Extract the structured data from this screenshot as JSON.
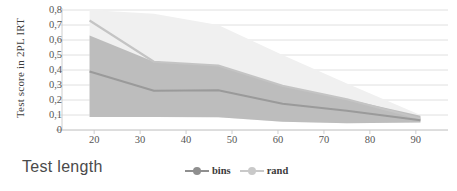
{
  "chart_data": {
    "type": "line",
    "title": "",
    "xlabel": "Test length",
    "ylabel": "Test score in 2PL IRT",
    "xlim": [
      13,
      97
    ],
    "ylim": [
      0,
      0.8
    ],
    "grid": true,
    "legend_position": "bottom",
    "x_ticks": [
      "20",
      "30",
      "40",
      "50",
      "60",
      "70",
      "80",
      "90"
    ],
    "x_tick_values": [
      20,
      30,
      40,
      50,
      60,
      70,
      80,
      90
    ],
    "y_ticks": [
      "0",
      "0,1",
      "0,2",
      "0,3",
      "0,4",
      "0,5",
      "0,6",
      "0,7",
      "0,8"
    ],
    "y_tick_values": [
      0,
      0.1,
      0.2,
      0.3,
      0.4,
      0.5,
      0.6,
      0.7,
      0.8
    ],
    "x": [
      19,
      33,
      47,
      61,
      75,
      91
    ],
    "series": [
      {
        "name": "bins",
        "color": "#9a9a9a",
        "values": [
          0.39,
          0.262,
          0.265,
          0.175,
          0.128,
          0.065
        ],
        "band_upper": [
          0.63,
          0.455,
          0.43,
          0.295,
          0.205,
          0.095
        ],
        "band_lower": [
          0.087,
          0.086,
          0.085,
          0.055,
          0.045,
          0.05
        ],
        "band_color": "#bdbdbd"
      },
      {
        "name": "rand",
        "color": "#c4c4c4",
        "values": [
          0.73,
          0.455,
          0.43,
          0.295,
          0.205,
          0.075
        ],
        "band_upper": [
          0.8,
          0.775,
          0.7,
          0.5,
          0.31,
          0.1
        ],
        "band_lower": [
          0.087,
          0.086,
          0.085,
          0.055,
          0.045,
          0.05
        ],
        "band_color": "#f0f0f0"
      }
    ]
  },
  "legend": {
    "items": [
      {
        "label": "bins",
        "color": "#8f8f8f"
      },
      {
        "label": "rand",
        "color": "#c9c9c9"
      }
    ]
  },
  "axis": {
    "x_title": "Test length",
    "y_title": "Test score in 2PL IRT"
  },
  "colors": {
    "grid": "#dcdcdc",
    "axis_line": "#c8c8c8",
    "tick_text": "#555555",
    "bins_line": "#8f8f8f",
    "rand_line": "#c9c9c9",
    "bins_band": "#bdbdbd",
    "rand_band": "#f0f0f0",
    "background": "#ffffff"
  }
}
